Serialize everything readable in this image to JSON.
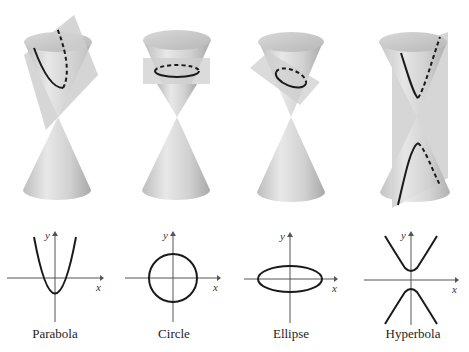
{
  "figure": {
    "panels": [
      {
        "id": "parabola",
        "label": "Parabola",
        "x_axis": "x",
        "y_axis": "y"
      },
      {
        "id": "circle",
        "label": "Circle",
        "x_axis": "x",
        "y_axis": "y"
      },
      {
        "id": "ellipse",
        "label": "Ellipse",
        "x_axis": "x",
        "y_axis": "y"
      },
      {
        "id": "hyperbola",
        "label": "Hyperbola",
        "x_axis": "x",
        "y_axis": "y"
      }
    ]
  },
  "colors": {
    "cone_light": "#e6e6e6",
    "cone_mid": "#c4c4c4",
    "cone_dark": "#a8a8a8",
    "plane": "#cfcfcf",
    "curve": "#1a1a1a",
    "axis": "#555555",
    "text": "#222222"
  }
}
